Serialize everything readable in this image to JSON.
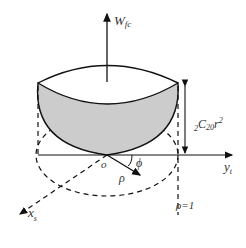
{
  "labels": {
    "force": "W",
    "force_sub": "fc",
    "height_pre": "2",
    "height_main": "C",
    "height_sub": "20",
    "height_r": "r",
    "height_exp": "2",
    "y_axis": "y",
    "y_axis_sub": "t",
    "x_axis": "x",
    "x_axis_sub": "s",
    "origin": "o",
    "rho": "ρ",
    "phi": "ϕ",
    "unit_circle": "ρ=1"
  },
  "colors": {
    "stroke": "#111111",
    "fill": "#cccccc",
    "text": "#333333"
  }
}
